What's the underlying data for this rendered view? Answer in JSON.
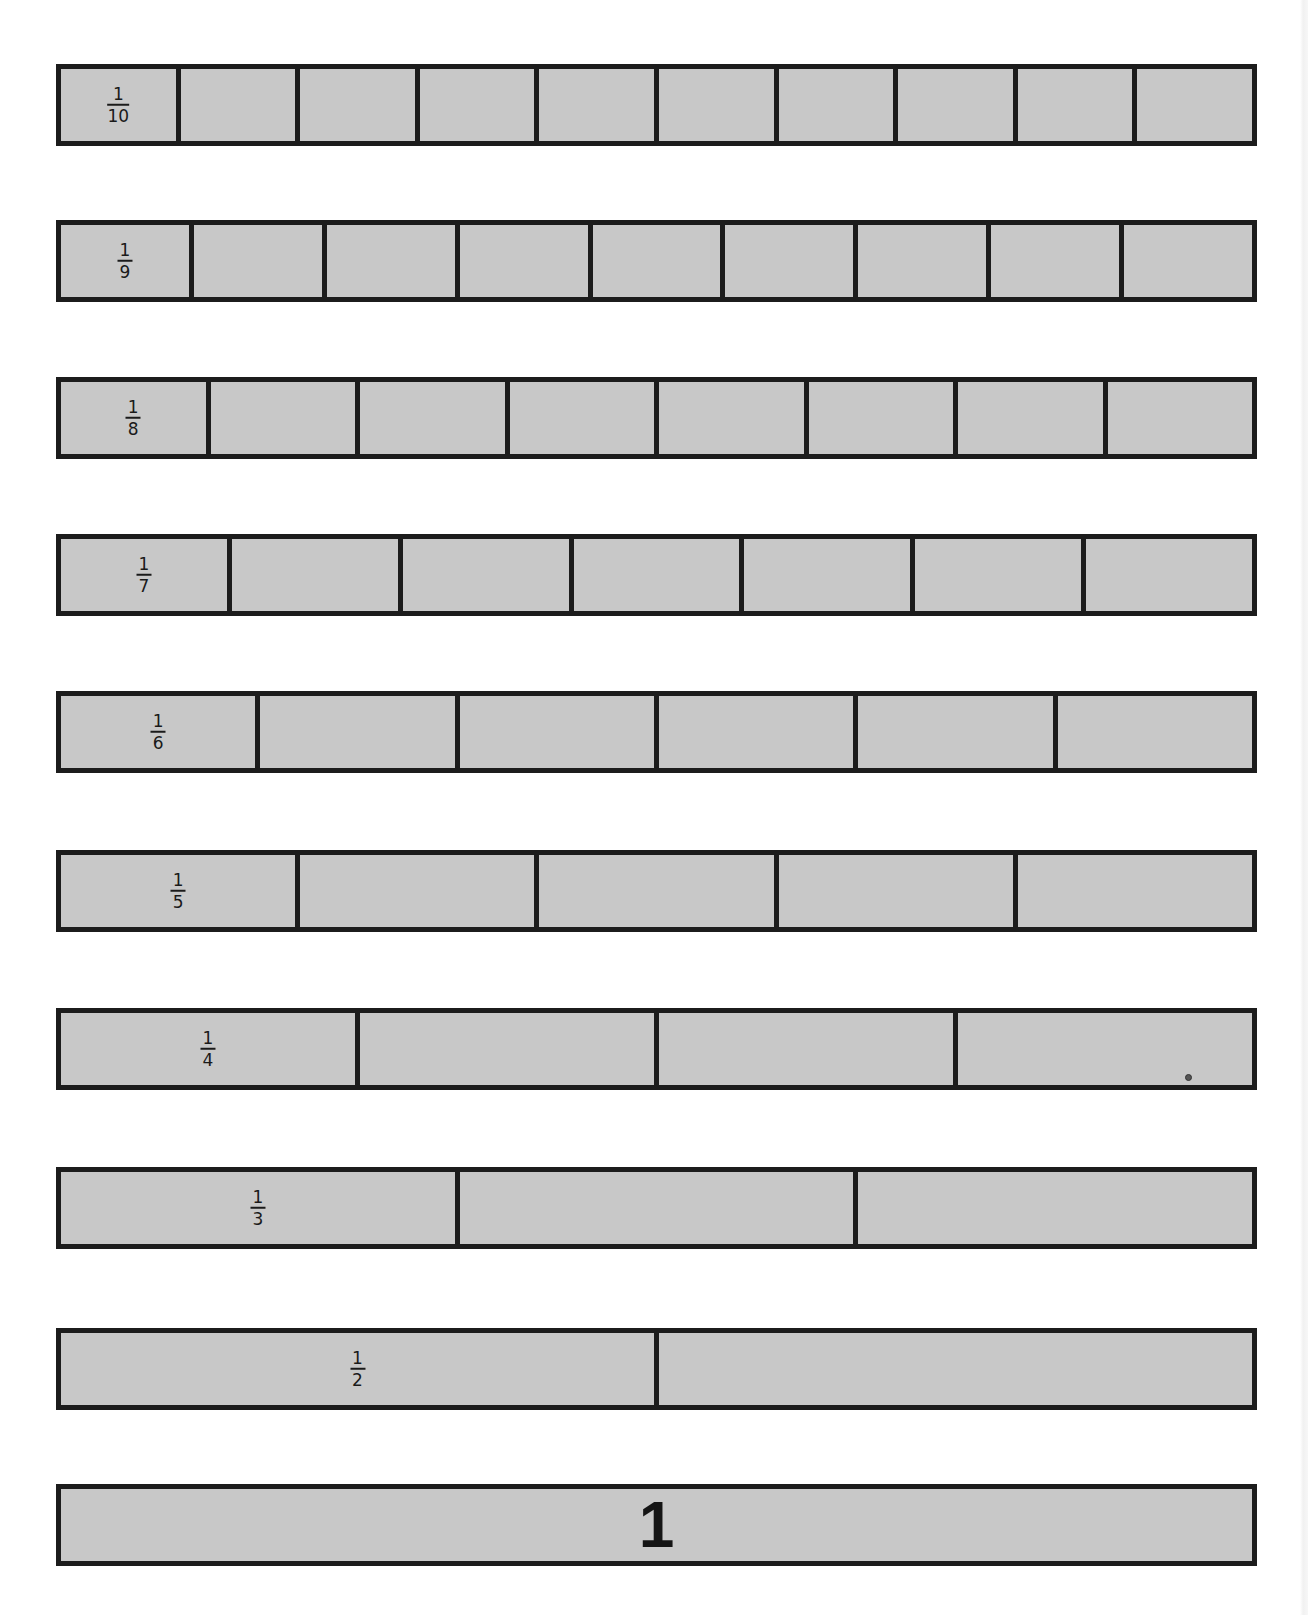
{
  "colors": {
    "background": "#ffffff",
    "strip_fill": "#c8c8c8",
    "border": "#1c1c1c",
    "text": "#1a1a1a"
  },
  "strips": [
    {
      "id": "tenths",
      "label_num": "1",
      "label_den": "10",
      "parts": 10,
      "top": 64
    },
    {
      "id": "ninths",
      "label_num": "1",
      "label_den": "9",
      "parts": 9,
      "top": 220
    },
    {
      "id": "eighths",
      "label_num": "1",
      "label_den": "8",
      "parts": 8,
      "top": 377
    },
    {
      "id": "sevenths",
      "label_num": "1",
      "label_den": "7",
      "parts": 7,
      "top": 534
    },
    {
      "id": "sixths",
      "label_num": "1",
      "label_den": "6",
      "parts": 6,
      "top": 691
    },
    {
      "id": "fifths",
      "label_num": "1",
      "label_den": "5",
      "parts": 5,
      "top": 850
    },
    {
      "id": "fourths",
      "label_num": "1",
      "label_den": "4",
      "parts": 4,
      "top": 1008
    },
    {
      "id": "thirds",
      "label_num": "1",
      "label_den": "3",
      "parts": 3,
      "top": 1167
    },
    {
      "id": "halves",
      "label_num": "1",
      "label_den": "2",
      "parts": 2,
      "top": 1328
    }
  ],
  "whole": {
    "label": "1",
    "parts": 1,
    "top": 1484
  },
  "marks": [
    {
      "name": "dot-mark",
      "x": 1185,
      "y": 1074
    }
  ]
}
